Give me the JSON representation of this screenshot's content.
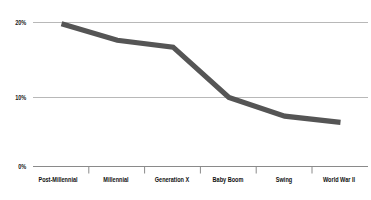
{
  "chart_data": {
    "type": "line",
    "title": "",
    "subtitle": "",
    "xlabel": "",
    "ylabel": "",
    "categories": [
      "Post-Millennial",
      "Millennial",
      "Generation X",
      "Baby Boom",
      "Swing",
      "World War II"
    ],
    "values": [
      20.7,
      18.3,
      17.3,
      10.0,
      7.3,
      6.4
    ],
    "series": [
      {
        "name": "Share",
        "values": [
          20.7,
          18.3,
          17.3,
          10.0,
          7.3,
          6.4
        ]
      }
    ],
    "ylim": [
      0,
      22
    ],
    "yticks": [
      0,
      10,
      20
    ],
    "ytick_labels": [
      "0%",
      "10%",
      "20%"
    ],
    "grid": true,
    "legend": false,
    "legend_position": "none",
    "line_color": "#555555",
    "grid_color": "#b8b8b8",
    "axis_color": "#8a8a8a",
    "text_color": "#111111"
  },
  "axis": {
    "y_labels": [
      "20%",
      "10%",
      "0%"
    ],
    "x_labels": [
      "Post-Millennial",
      "Millennial",
      "Generation X",
      "Baby Boom",
      "Swing",
      "World War II"
    ]
  }
}
